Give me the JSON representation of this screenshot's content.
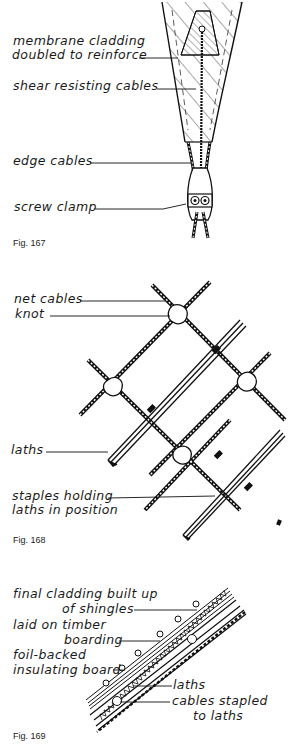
{
  "figures": [
    {
      "caption": "Fig. 167",
      "labels": {
        "membrane_line1": "membrane cladding",
        "membrane_line2": "doubled to reinforce",
        "shear": "shear resisting cables",
        "edge": "edge cables",
        "clamp": "screw clamp"
      }
    },
    {
      "caption": "Fig. 168",
      "labels": {
        "net_cables": "net cables",
        "knot": "knot",
        "laths": "laths",
        "staples_line1": "staples holding",
        "staples_line2": "laths in position"
      }
    },
    {
      "caption": "Fig. 169",
      "labels": {
        "final_line1": "final cladding built up",
        "final_line2": "of shingles",
        "timber_line1": "laid on timber",
        "timber_line2": "boarding",
        "foil_line1": "foil-backed",
        "foil_line2": "insulating board",
        "laths": "laths",
        "cables_line1": "cables stapled",
        "cables_line2": "to laths"
      }
    }
  ]
}
